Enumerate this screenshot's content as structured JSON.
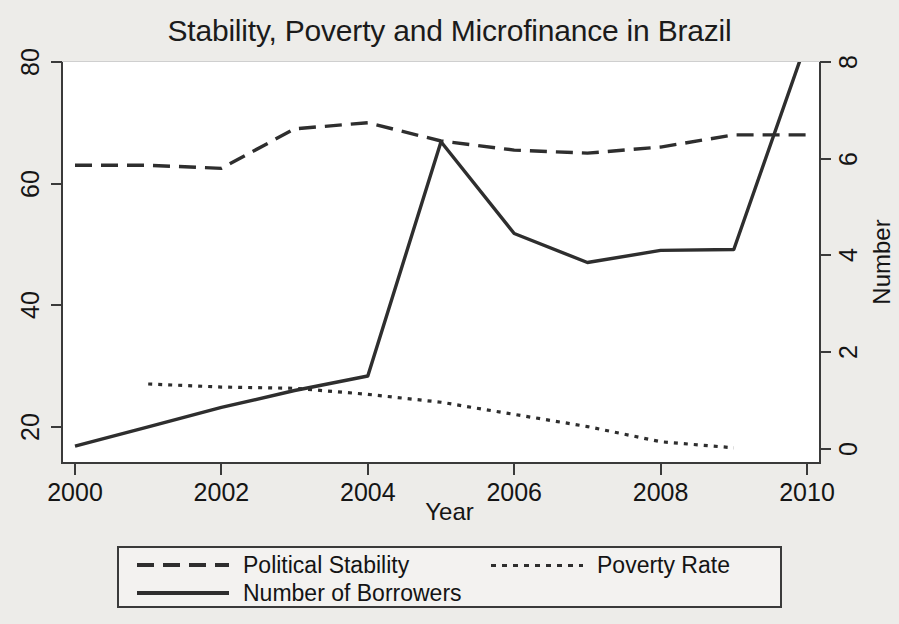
{
  "chart_data": {
    "type": "line",
    "title": "Stability, Poverty and Microfinance in Brazil",
    "xlabel": "Year",
    "ylabel": "",
    "ylabel_right": "Number",
    "x": [
      2000,
      2001,
      2002,
      2003,
      2004,
      2005,
      2006,
      2007,
      2008,
      2009,
      2010
    ],
    "xlim": [
      2000,
      2010
    ],
    "xticks": [
      "2000",
      "2002",
      "2004",
      "2006",
      "2008",
      "2010"
    ],
    "xtick_values": [
      2000,
      2002,
      2004,
      2006,
      2008,
      2010
    ],
    "ylim": [
      14,
      80
    ],
    "yticks": [
      "20",
      "40",
      "60",
      "80"
    ],
    "ytick_values": [
      20,
      40,
      60,
      80
    ],
    "ylim_right": [
      -0.3,
      8.0
    ],
    "yticks_right": [
      "0",
      "2",
      "4",
      "6",
      "8"
    ],
    "ytick_values_right": [
      0,
      2,
      4,
      6,
      8
    ],
    "grid": false,
    "legend_position": "below-plot",
    "series": [
      {
        "name": "Political Stability",
        "axis": "left",
        "style": "dashed",
        "color": "#2e2e2e",
        "x": [
          2000,
          2001,
          2002,
          2003,
          2004,
          2005,
          2006,
          2007,
          2008,
          2009,
          2010
        ],
        "values": [
          63.0,
          63.0,
          62.5,
          69.0,
          70.0,
          67.0,
          65.5,
          65.0,
          66.0,
          68.0,
          68.0
        ]
      },
      {
        "name": "Poverty Rate",
        "axis": "left",
        "style": "dotted",
        "color": "#2e2e2e",
        "x": [
          2001,
          2002,
          2003,
          2004,
          2005,
          2006,
          2007,
          2008,
          2009
        ],
        "values": [
          27.0,
          26.5,
          26.3,
          25.3,
          24.0,
          22.0,
          20.0,
          17.5,
          16.5
        ]
      },
      {
        "name": "Number of Borrowers",
        "axis": "right",
        "style": "solid",
        "color": "#2e2e2e",
        "x": [
          2000,
          2001,
          2002,
          2003,
          2004,
          2005,
          2006,
          2007,
          2008,
          2009,
          2010
        ],
        "values": [
          0.05,
          0.45,
          0.85,
          1.2,
          1.5,
          6.35,
          4.45,
          3.85,
          4.1,
          4.12,
          8.45
        ]
      }
    ]
  },
  "legend": {
    "items": [
      {
        "label": "Political Stability",
        "style": "dashed"
      },
      {
        "label": "Poverty Rate",
        "style": "dotted"
      },
      {
        "label": "Number of Borrowers",
        "style": "solid"
      }
    ]
  }
}
